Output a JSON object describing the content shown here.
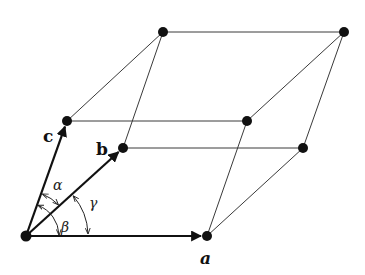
{
  "diagram": {
    "colors": {
      "line": "#3a3a3a",
      "vector": "#111111",
      "node": "#111111",
      "background": "#ffffff"
    },
    "nodes": [
      {
        "id": "O",
        "x": 26,
        "y": 236
      },
      {
        "id": "A",
        "x": 207,
        "y": 236
      },
      {
        "id": "B",
        "x": 123,
        "y": 148
      },
      {
        "id": "C",
        "x": 67,
        "y": 121
      },
      {
        "id": "AB",
        "x": 303,
        "y": 148
      },
      {
        "id": "AC",
        "x": 247,
        "y": 121
      },
      {
        "id": "BC",
        "x": 163,
        "y": 32
      },
      {
        "id": "ABC",
        "x": 344,
        "y": 32
      }
    ],
    "edges": [
      [
        "A",
        "AB"
      ],
      [
        "A",
        "AC"
      ],
      [
        "B",
        "AB"
      ],
      [
        "B",
        "BC"
      ],
      [
        "C",
        "AC"
      ],
      [
        "C",
        "BC"
      ],
      [
        "AB",
        "ABC"
      ],
      [
        "AC",
        "ABC"
      ],
      [
        "BC",
        "ABC"
      ]
    ],
    "vectors": [
      {
        "name": "a",
        "label": "a",
        "from": "O",
        "to": "A"
      },
      {
        "name": "b",
        "label": "b",
        "from": "O",
        "to": "B"
      },
      {
        "name": "c",
        "label": "c",
        "from": "O",
        "to": "C"
      }
    ],
    "angles": [
      {
        "name": "alpha",
        "label": "α",
        "between": [
          "b",
          "c"
        ]
      },
      {
        "name": "beta",
        "label": "β",
        "between": [
          "a",
          "c"
        ]
      },
      {
        "name": "gamma",
        "label": "γ",
        "between": [
          "a",
          "b"
        ]
      }
    ],
    "labels": {
      "a": "a",
      "b": "b",
      "c": "c",
      "alpha": "α",
      "beta": "β",
      "gamma": "γ"
    }
  }
}
